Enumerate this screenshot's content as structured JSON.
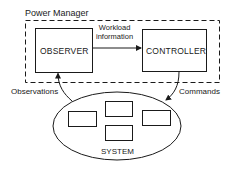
{
  "diagram": {
    "container": {
      "label": "Power Manager",
      "style": "dashed"
    },
    "nodes": [
      {
        "id": "observer",
        "label": "OBSERVER"
      },
      {
        "id": "controller",
        "label": "CONTROLLER"
      },
      {
        "id": "system",
        "label": "SYSTEM",
        "shape": "ellipse",
        "sub_components": 4
      }
    ],
    "edges": [
      {
        "from": "observer",
        "to": "controller",
        "label_line1": "Workload",
        "label_line2": "information"
      },
      {
        "from": "system",
        "to": "observer",
        "label": "Observations"
      },
      {
        "from": "controller",
        "to": "system",
        "label": "Commands"
      }
    ],
    "colors": {
      "stroke": "#1a1a1a",
      "background": "#ffffff"
    }
  }
}
